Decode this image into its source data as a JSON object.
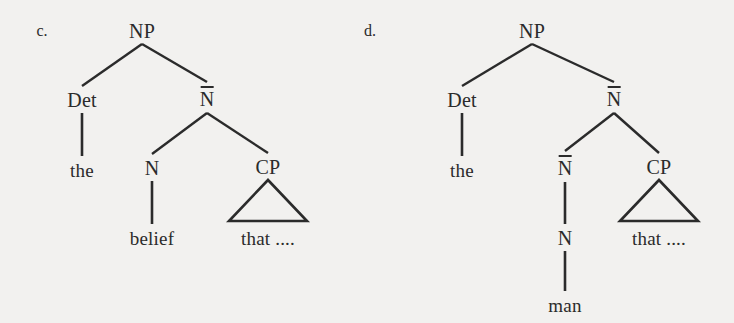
{
  "figure": {
    "background_color": "#f2f1ef",
    "stroke_color": "#2b2b2b",
    "width": 734,
    "height": 323
  },
  "trees": [
    {
      "marker": "c.",
      "marker_pos": {
        "x": 42,
        "y": 31
      },
      "nodes": [
        {
          "id": "np",
          "label": "NP",
          "barred": false,
          "terminal": false,
          "x": 142,
          "y": 31
        },
        {
          "id": "det",
          "label": "Det",
          "barred": false,
          "terminal": false,
          "x": 82,
          "y": 100
        },
        {
          "id": "nbar",
          "label": "N",
          "barred": true,
          "terminal": false,
          "x": 207,
          "y": 99
        },
        {
          "id": "the",
          "label": "the",
          "barred": false,
          "terminal": true,
          "x": 82,
          "y": 170
        },
        {
          "id": "n",
          "label": "N",
          "barred": false,
          "terminal": false,
          "x": 152,
          "y": 168
        },
        {
          "id": "cp",
          "label": "CP",
          "barred": false,
          "terminal": false,
          "x": 268,
          "y": 167
        },
        {
          "id": "belief",
          "label": "belief",
          "barred": false,
          "terminal": true,
          "x": 152,
          "y": 238
        },
        {
          "id": "that",
          "label": "that ....",
          "barred": false,
          "terminal": true,
          "x": 268,
          "y": 238
        }
      ],
      "edges": [
        {
          "from": "np",
          "to": "det"
        },
        {
          "from": "np",
          "to": "nbar"
        },
        {
          "from": "det",
          "to": "the"
        },
        {
          "from": "nbar",
          "to": "n"
        },
        {
          "from": "nbar",
          "to": "cp"
        },
        {
          "from": "n",
          "to": "belief"
        }
      ],
      "triangles": [
        {
          "under": "cp",
          "apex_y": 180,
          "base_y": 221,
          "half_width": 39
        }
      ]
    },
    {
      "marker": "d.",
      "marker_pos": {
        "x": 370,
        "y": 31
      },
      "nodes": [
        {
          "id": "np",
          "label": "NP",
          "barred": false,
          "terminal": false,
          "x": 532,
          "y": 31
        },
        {
          "id": "det",
          "label": "Det",
          "barred": false,
          "terminal": false,
          "x": 462,
          "y": 100
        },
        {
          "id": "nbar",
          "label": "N",
          "barred": true,
          "terminal": false,
          "x": 614,
          "y": 99
        },
        {
          "id": "the",
          "label": "the",
          "barred": false,
          "terminal": true,
          "x": 462,
          "y": 170
        },
        {
          "id": "nbar2",
          "label": "N",
          "barred": true,
          "terminal": false,
          "x": 565,
          "y": 168
        },
        {
          "id": "cp",
          "label": "CP",
          "barred": false,
          "terminal": false,
          "x": 659,
          "y": 167
        },
        {
          "id": "n",
          "label": "N",
          "barred": false,
          "terminal": false,
          "x": 565,
          "y": 238
        },
        {
          "id": "man",
          "label": "man",
          "barred": false,
          "terminal": true,
          "x": 565,
          "y": 305
        },
        {
          "id": "that",
          "label": "that ....",
          "barred": false,
          "terminal": true,
          "x": 659,
          "y": 238
        }
      ],
      "edges": [
        {
          "from": "np",
          "to": "det"
        },
        {
          "from": "np",
          "to": "nbar"
        },
        {
          "from": "det",
          "to": "the"
        },
        {
          "from": "nbar",
          "to": "nbar2"
        },
        {
          "from": "nbar",
          "to": "cp"
        },
        {
          "from": "nbar2",
          "to": "n"
        },
        {
          "from": "n",
          "to": "man"
        }
      ],
      "triangles": [
        {
          "under": "cp",
          "apex_y": 180,
          "base_y": 221,
          "half_width": 39
        }
      ]
    }
  ]
}
